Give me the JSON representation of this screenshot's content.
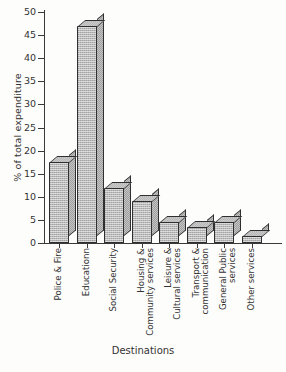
{
  "chart_data": {
    "type": "bar",
    "title": "",
    "xlabel": "Destinations",
    "ylabel": "% of total expenditure",
    "ylim": [
      0,
      50
    ],
    "yticks": [
      0,
      5,
      10,
      15,
      20,
      25,
      30,
      35,
      40,
      45,
      50
    ],
    "grid": false,
    "legend": null,
    "note": "First bar is clipped by the top edge of the plot area; rendered 3D block bars with hatched grey fill.",
    "categories": [
      "Police & Fire",
      "Educationn",
      "Social Security",
      "Housing &\nCommunity services",
      "Leisure &\nCultural services",
      "Transport &\ncommunication",
      "General Public\nservices",
      "Other services"
    ],
    "values": [
      17.5,
      47,
      12,
      9,
      4.5,
      3.5,
      4.5,
      1.5
    ]
  },
  "axis": {
    "y_title": "% of total expenditure",
    "x_title": "Destinations"
  },
  "colors": {
    "bar_face": "#b9b9b9",
    "bar_side": "#9f9f9f",
    "bar_top": "#cacaca",
    "outline": "#2f2f2f",
    "axis": "#3a3a3a",
    "background": "#fdfdfb"
  }
}
